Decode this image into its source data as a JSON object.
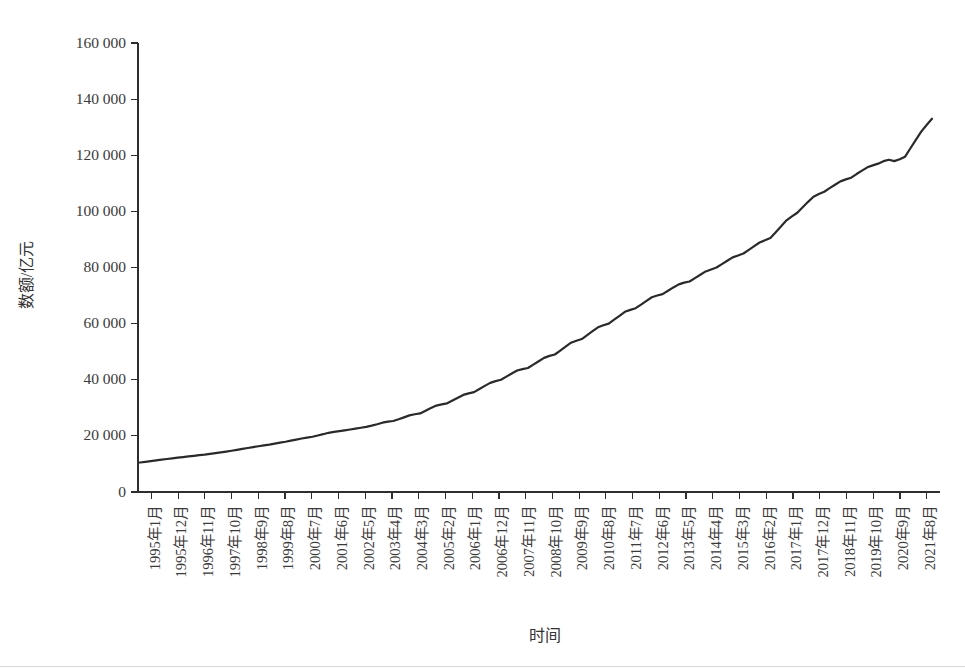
{
  "chart_data": {
    "type": "line",
    "title": "",
    "xlabel": "时间",
    "ylabel": "数额/亿元",
    "ylim": [
      0,
      160000
    ],
    "yticks": [
      0,
      20000,
      40000,
      60000,
      80000,
      100000,
      120000,
      140000,
      160000
    ],
    "ytick_labels": [
      "0",
      "20 000",
      "40 000",
      "60 000",
      "80 000",
      "100 000",
      "120 000",
      "140 000",
      "160 000"
    ],
    "grid": false,
    "legend": null,
    "line_color": "#2a2a2a",
    "xtick_labels": [
      "1995年1月",
      "1995年12月",
      "1996年11月",
      "1997年10月",
      "1998年9月",
      "1999年8月",
      "2000年7月",
      "2001年6月",
      "2002年5月",
      "2003年4月",
      "2004年3月",
      "2005年2月",
      "2006年1月",
      "2006年12月",
      "2007年11月",
      "2008年10月",
      "2009年9月",
      "2010年8月",
      "2011年7月",
      "2012年6月",
      "2013年5月",
      "2014年4月",
      "2015年3月",
      "2016年2月",
      "2017年1月",
      "2017年12月",
      "2018年11月",
      "2019年10月",
      "2020年9月",
      "2021年8月"
    ],
    "x": [
      "1995年1月",
      "1995年12月",
      "1996年11月",
      "1997年10月",
      "1998年9月",
      "1999年8月",
      "2000年7月",
      "2001年6月",
      "2002年5月",
      "2003年4月",
      "2004年3月",
      "2005年2月",
      "2006年1月",
      "2006年12月",
      "2007年11月",
      "2008年10月",
      "2009年9月",
      "2010年8月",
      "2011年7月",
      "2012年6月",
      "2013年5月",
      "2014年4月",
      "2015年3月",
      "2016年2月",
      "2017年1月",
      "2017年12月",
      "2018年11月",
      "2019年10月",
      "2020年9月",
      "2021年8月"
    ],
    "series": [
      {
        "name": "数额",
        "values": [
          10500,
          12000,
          13300,
          14700,
          16300,
          17900,
          19700,
          21700,
          23200,
          25300,
          28000,
          31600,
          35600,
          40000,
          44200,
          49000,
          54500,
          60000,
          65500,
          70500,
          75000,
          80000,
          85000,
          90500,
          99500,
          107000,
          112000,
          117000,
          119500,
          133000
        ]
      }
    ],
    "dense_values": [
      10500,
      10750,
      11000,
      11250,
      11520,
      11760,
      12000,
      12230,
      12450,
      12680,
      12900,
      13120,
      13300,
      13560,
      13830,
      14100,
      14400,
      14700,
      15020,
      15350,
      15680,
      16000,
      16300,
      16600,
      16900,
      17250,
      17600,
      17900,
      18280,
      18650,
      19050,
      19400,
      19700,
      20150,
      20600,
      21100,
      21400,
      21700,
      21990,
      22280,
      22580,
      22900,
      23200,
      23650,
      24150,
      24700,
      25050,
      25300,
      25900,
      26600,
      27300,
      27700,
      28000,
      28950,
      29900,
      30800,
      31200,
      31600,
      32600,
      33600,
      34600,
      35150,
      35600,
      36700,
      37800,
      38900,
      39500,
      40000,
      41100,
      42200,
      43300,
      43800,
      44200,
      45400,
      46600,
      47800,
      48500,
      49000,
      50400,
      51800,
      53200,
      53900,
      54500,
      55900,
      57300,
      58700,
      59400,
      60000,
      61400,
      62800,
      64200,
      64900,
      65500,
      66800,
      68100,
      69400,
      70000,
      70500,
      71700,
      72900,
      74000,
      74600,
      75000,
      76200,
      77400,
      78600,
      79300,
      80000,
      81200,
      82400,
      83600,
      84300,
      85000,
      86300,
      87600,
      88900,
      89700,
      90500,
      92600,
      94700,
      96800,
      98200,
      99500,
      101500,
      103400,
      105200,
      106200,
      107000,
      108300,
      109500,
      110700,
      111400,
      112000,
      113300,
      114500,
      115700,
      116400,
      117000,
      117900,
      118400,
      117900,
      118600,
      119500,
      122500,
      125500,
      128400,
      130800,
      133000
    ],
    "dense_start_label": "1995年1月",
    "dense_end_label": "2021年8月"
  }
}
